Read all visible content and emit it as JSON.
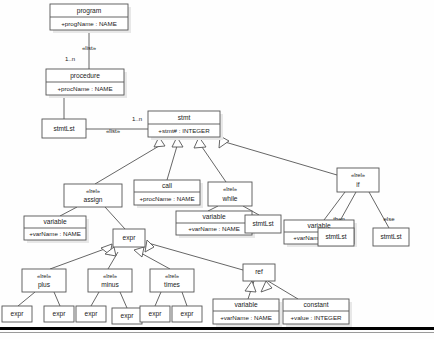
{
  "diagram": {
    "kind": "uml-class-diagram",
    "title": "",
    "canvas": {
      "width": 434,
      "height": 339,
      "background": "#fefefe"
    },
    "palette": {
      "box_fill": "#ffffff",
      "box_stroke": "#555555",
      "shadow": "#e8e8e8",
      "text": "#1a1a1a",
      "rule_dark": "#000000",
      "rule_light": "#9a9a9a"
    },
    "classes": [
      {
        "id": "program",
        "stereotype": "",
        "name": "program",
        "attribute": "+progName : NAME",
        "x": 50,
        "y": 4,
        "w": 78,
        "h": 26,
        "header_h": 13
      },
      {
        "id": "procedure",
        "stereotype": "",
        "name": "procedure",
        "attribute": "+procName : NAME",
        "x": 46,
        "y": 69,
        "w": 78,
        "h": 26,
        "header_h": 13
      },
      {
        "id": "stmtLst1",
        "stereotype": "",
        "name": "stmtLst",
        "attribute": "",
        "x": 42,
        "y": 119,
        "w": 44,
        "h": 19,
        "header_h": 19
      },
      {
        "id": "stmt",
        "stereotype": "",
        "name": "stmt",
        "attribute": "+stmt# : INTEGER",
        "x": 148,
        "y": 111,
        "w": 72,
        "h": 26,
        "header_h": 13
      },
      {
        "id": "assign",
        "stereotype": "«lrel»",
        "name": "assign",
        "attribute": "",
        "x": 64,
        "y": 184,
        "w": 58,
        "h": 23,
        "header_h": 23
      },
      {
        "id": "call",
        "stereotype": "",
        "name": "call",
        "attribute": "+procName : NAME",
        "x": 134,
        "y": 180,
        "w": 66,
        "h": 25,
        "header_h": 12
      },
      {
        "id": "while",
        "stereotype": "«lrel»",
        "name": "while",
        "attribute": "",
        "x": 208,
        "y": 182,
        "w": 44,
        "h": 24,
        "header_h": 24
      },
      {
        "id": "if",
        "stereotype": "«lrel»",
        "name": "if",
        "attribute": "",
        "x": 337,
        "y": 168,
        "w": 42,
        "h": 24,
        "header_h": 24
      },
      {
        "id": "varAssign",
        "stereotype": "",
        "name": "variable",
        "attribute": "+varName : NAME",
        "x": 24,
        "y": 216,
        "w": 62,
        "h": 24,
        "header_h": 12
      },
      {
        "id": "varWhile",
        "stereotype": "",
        "name": "variable",
        "attribute": "+varName : NAME",
        "x": 176,
        "y": 211,
        "w": 76,
        "h": 24,
        "header_h": 12
      },
      {
        "id": "varIf",
        "stereotype": "",
        "name": "variable",
        "attribute": "+varName : NAME",
        "x": 284,
        "y": 220,
        "w": 70,
        "h": 24,
        "header_h": 12
      },
      {
        "id": "stmtLst2",
        "stereotype": "",
        "name": "stmtLst",
        "attribute": "",
        "x": 245,
        "y": 215,
        "w": 36,
        "h": 18,
        "header_h": 18
      },
      {
        "id": "stmtLst3",
        "stereotype": "",
        "name": "stmtLst",
        "attribute": "",
        "x": 318,
        "y": 228,
        "w": 36,
        "h": 18,
        "header_h": 18
      },
      {
        "id": "stmtLst4",
        "stereotype": "",
        "name": "stmtLst",
        "attribute": "",
        "x": 373,
        "y": 228,
        "w": 36,
        "h": 18,
        "header_h": 18
      },
      {
        "id": "expr",
        "stereotype": "",
        "name": "expr",
        "attribute": "",
        "x": 113,
        "y": 229,
        "w": 32,
        "h": 18,
        "header_h": 18
      },
      {
        "id": "plus",
        "stereotype": "«lrel»",
        "name": "plus",
        "attribute": "",
        "x": 22,
        "y": 269,
        "w": 44,
        "h": 23,
        "header_h": 23
      },
      {
        "id": "minus",
        "stereotype": "«lrel»",
        "name": "minus",
        "attribute": "",
        "x": 88,
        "y": 269,
        "w": 44,
        "h": 23,
        "header_h": 23
      },
      {
        "id": "times",
        "stereotype": "«lrel»",
        "name": "times",
        "attribute": "",
        "x": 150,
        "y": 269,
        "w": 44,
        "h": 23,
        "header_h": 23
      },
      {
        "id": "ref",
        "stereotype": "",
        "name": "ref",
        "attribute": "",
        "x": 243,
        "y": 264,
        "w": 32,
        "h": 17,
        "header_h": 17
      },
      {
        "id": "expr1",
        "stereotype": "",
        "name": "expr",
        "attribute": "",
        "x": 2,
        "y": 306,
        "w": 30,
        "h": 16,
        "header_h": 16
      },
      {
        "id": "expr2",
        "stereotype": "",
        "name": "expr",
        "attribute": "",
        "x": 44,
        "y": 306,
        "w": 30,
        "h": 16,
        "header_h": 16
      },
      {
        "id": "expr3",
        "stereotype": "",
        "name": "expr",
        "attribute": "",
        "x": 76,
        "y": 306,
        "w": 30,
        "h": 16,
        "header_h": 16
      },
      {
        "id": "expr4",
        "stereotype": "",
        "name": "expr",
        "attribute": "",
        "x": 112,
        "y": 308,
        "w": 30,
        "h": 16,
        "header_h": 16
      },
      {
        "id": "expr5",
        "stereotype": "",
        "name": "expr",
        "attribute": "",
        "x": 140,
        "y": 306,
        "w": 30,
        "h": 16,
        "header_h": 16
      },
      {
        "id": "expr6",
        "stereotype": "",
        "name": "expr",
        "attribute": "",
        "x": 172,
        "y": 306,
        "w": 30,
        "h": 16,
        "header_h": 16
      },
      {
        "id": "varRef",
        "stereotype": "",
        "name": "variable",
        "attribute": "+varName : NAME",
        "x": 213,
        "y": 299,
        "w": 66,
        "h": 25,
        "header_h": 12
      },
      {
        "id": "constant",
        "stereotype": "",
        "name": "constant",
        "attribute": "+value : INTEGER",
        "x": 283,
        "y": 299,
        "w": 66,
        "h": 25,
        "header_h": 12
      }
    ],
    "edge_labels": [
      {
        "id": "list1",
        "text": "«list»",
        "x": 89,
        "y": 48
      },
      {
        "id": "mult1",
        "text": "1..n",
        "x": 70,
        "y": 59
      },
      {
        "id": "list2",
        "text": "«list»",
        "x": 113,
        "y": 131
      },
      {
        "id": "mult2",
        "text": "1..n",
        "x": 137,
        "y": 119
      },
      {
        "id": "then",
        "text": "then",
        "x": 339,
        "y": 219
      },
      {
        "id": "else",
        "text": "else",
        "x": 389,
        "y": 219
      }
    ],
    "associations": [
      {
        "id": "program-procedure",
        "from": "program",
        "to": "procedure",
        "label": "«list»",
        "multiplicity": "1..n"
      },
      {
        "id": "procedure-stmtLst",
        "from": "procedure",
        "to": "stmtLst1",
        "label": "",
        "multiplicity": ""
      },
      {
        "id": "stmtLst-stmt",
        "from": "stmtLst1",
        "to": "stmt",
        "label": "«list»",
        "multiplicity": "1..n"
      },
      {
        "id": "assign-variable",
        "from": "assign",
        "to": "varAssign",
        "label": "",
        "multiplicity": ""
      },
      {
        "id": "assign-expr",
        "from": "assign",
        "to": "expr",
        "label": "",
        "multiplicity": ""
      },
      {
        "id": "while-variable",
        "from": "while",
        "to": "varWhile",
        "label": "",
        "multiplicity": ""
      },
      {
        "id": "while-stmtLst",
        "from": "while",
        "to": "stmtLst2",
        "label": "",
        "multiplicity": ""
      },
      {
        "id": "if-variable",
        "from": "if",
        "to": "varIf",
        "label": "",
        "multiplicity": ""
      },
      {
        "id": "if-then-stmtLst",
        "from": "if",
        "to": "stmtLst3",
        "label": "then",
        "multiplicity": ""
      },
      {
        "id": "if-else-stmtLst",
        "from": "if",
        "to": "stmtLst4",
        "label": "else",
        "multiplicity": ""
      },
      {
        "id": "plus-expr-left",
        "from": "plus",
        "to": "expr1",
        "label": "",
        "multiplicity": ""
      },
      {
        "id": "plus-expr-right",
        "from": "plus",
        "to": "expr2",
        "label": "",
        "multiplicity": ""
      },
      {
        "id": "minus-expr-left",
        "from": "minus",
        "to": "expr3",
        "label": "",
        "multiplicity": ""
      },
      {
        "id": "minus-expr-right",
        "from": "minus",
        "to": "expr4",
        "label": "",
        "multiplicity": ""
      },
      {
        "id": "times-expr-left",
        "from": "times",
        "to": "expr5",
        "label": "",
        "multiplicity": ""
      },
      {
        "id": "times-expr-right",
        "from": "times",
        "to": "expr6",
        "label": "",
        "multiplicity": ""
      }
    ],
    "generalizations": [
      {
        "id": "assign-stmt",
        "child": "assign",
        "parent": "stmt"
      },
      {
        "id": "call-stmt",
        "child": "call",
        "parent": "stmt"
      },
      {
        "id": "while-stmt",
        "child": "while",
        "parent": "stmt"
      },
      {
        "id": "if-stmt",
        "child": "if",
        "parent": "stmt"
      },
      {
        "id": "plus-expr",
        "child": "plus",
        "parent": "expr"
      },
      {
        "id": "minus-expr",
        "child": "minus",
        "parent": "expr"
      },
      {
        "id": "times-expr",
        "child": "times",
        "parent": "expr"
      },
      {
        "id": "ref-expr",
        "child": "ref",
        "parent": "expr"
      },
      {
        "id": "variable-ref",
        "child": "varRef",
        "parent": "ref"
      },
      {
        "id": "constant-ref",
        "child": "constant",
        "parent": "ref"
      }
    ]
  }
}
